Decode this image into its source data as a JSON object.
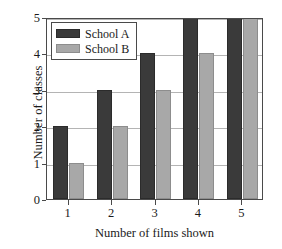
{
  "chart_data": {
    "type": "bar",
    "title": "",
    "xlabel": "Number of films shown",
    "ylabel": "Number of classes",
    "categories": [
      "1",
      "2",
      "3",
      "4",
      "5"
    ],
    "series": [
      {
        "name": "School A",
        "color": "#3a3a3a",
        "values": [
          2,
          3,
          4,
          5,
          5
        ]
      },
      {
        "name": "School B",
        "color": "#a8a8a8",
        "values": [
          1,
          2,
          3,
          4,
          5
        ]
      }
    ],
    "ylim": [
      0,
      5
    ],
    "yticks": [
      0,
      1,
      2,
      3,
      4,
      5
    ],
    "ytick_labels": [
      "0",
      "1",
      "2",
      "3",
      "4",
      "5"
    ],
    "xtick_labels": [
      "1",
      "2",
      "3",
      "4",
      "5"
    ],
    "grid": "horizontal",
    "legend_position": "top-left",
    "legend_entries": [
      "School A",
      "School B"
    ],
    "frame_color": "#4a4a4a",
    "gridline_color": "#b4b4b4",
    "background": "#ffffff"
  }
}
